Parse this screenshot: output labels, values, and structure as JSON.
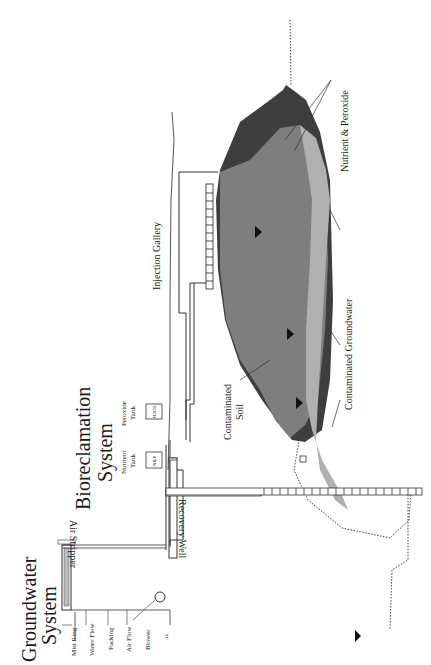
{
  "diagram": {
    "orientation": "rotated 90 degrees counter-clockwise",
    "titles": {
      "groundwater_system": [
        "Groundwater",
        "System"
      ],
      "bioreclamation_system": [
        "Bioreclamation",
        "System"
      ]
    },
    "air_stripper": {
      "label": "Air Stripper",
      "parts": [
        "Mist Ring",
        "Water Flow",
        "Packing",
        "Air Flow",
        "Blower"
      ],
      "air_label": "Air"
    },
    "tanks": [
      {
        "label": [
          "Nutrient",
          "Tank"
        ],
        "content": "N&P"
      },
      {
        "label": [
          "Peroxide",
          "Tank"
        ],
        "content": "H2O2"
      }
    ],
    "labels": {
      "injection_gallery": "Injection Gallery",
      "recovery_well": "Recovery Well",
      "contaminated_soil": [
        "Contaminated",
        "Soil"
      ],
      "contaminated_groundwater": "Contaminated Groundwater",
      "nutrient_peroxide": "Nutrient & Peroxide"
    },
    "colors": {
      "soil_dark": "#3a3a3a",
      "plume_mid": "#7a7a7a",
      "plume_light": "#a8a8a8",
      "groundwater_light": "#c4c4c4",
      "line": "#333333"
    }
  }
}
